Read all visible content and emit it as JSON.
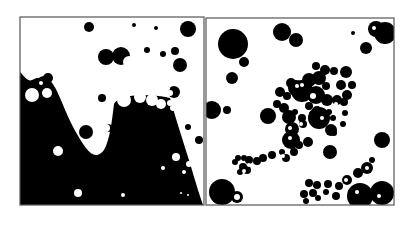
{
  "figure": {
    "background": "#ffffff",
    "ink": "#000000",
    "paper": "#ffffff",
    "frame_color": "#555555",
    "panels": [
      {
        "id": "left",
        "label": "disc packing over sloped terrain",
        "frame": {
          "x": 20,
          "y": 17,
          "w": 184,
          "h": 188
        },
        "terrain_path": "M20,72 C24,76 28,82 32,80 C38,78 42,74 48,78 C56,86 60,98 66,112 C72,126 80,140 86,148 C92,156 98,158 104,150 C110,140 112,120 114,104 C118,96 140,92 170,98 C176,120 186,150 192,170 C196,184 200,196 203,205 L20,205 Z",
        "black_discs": [
          [
            89,
            27,
            5
          ],
          [
            134,
            25,
            2
          ],
          [
            156,
            28,
            2
          ],
          [
            188,
            29,
            8
          ],
          [
            106,
            57,
            8
          ],
          [
            121,
            56,
            9
          ],
          [
            147,
            50,
            3
          ],
          [
            163,
            54,
            3
          ],
          [
            175,
            51,
            4
          ],
          [
            180,
            65,
            7
          ],
          [
            48,
            78,
            5
          ],
          [
            102,
            98,
            4
          ],
          [
            86,
            132,
            7
          ],
          [
            108,
            128,
            4
          ],
          [
            174,
            92,
            6
          ],
          [
            188,
            127,
            3
          ],
          [
            199,
            140,
            4
          ]
        ],
        "white_discs": [
          [
            36,
            71,
            3
          ],
          [
            38,
            75,
            3
          ],
          [
            32,
            95,
            7
          ],
          [
            47,
            93,
            5
          ],
          [
            41,
            83,
            2
          ],
          [
            129,
            62,
            6
          ],
          [
            137,
            54,
            3
          ],
          [
            146,
            59,
            3
          ],
          [
            140,
            67,
            3
          ],
          [
            155,
            64,
            3
          ],
          [
            131,
            74,
            3
          ],
          [
            140,
            73,
            3
          ],
          [
            148,
            72,
            3
          ],
          [
            157,
            73,
            3
          ],
          [
            164,
            80,
            3
          ],
          [
            125,
            83,
            3
          ],
          [
            133,
            82,
            3
          ],
          [
            141,
            81,
            3
          ],
          [
            150,
            82,
            3
          ],
          [
            158,
            83,
            3
          ],
          [
            167,
            88,
            3
          ],
          [
            122,
            90,
            3
          ],
          [
            130,
            89,
            3
          ],
          [
            138,
            89,
            3
          ],
          [
            146,
            91,
            3
          ],
          [
            154,
            90,
            3
          ],
          [
            162,
            91,
            3
          ],
          [
            170,
            93,
            3
          ],
          [
            124,
            100,
            7
          ],
          [
            140,
            97,
            6
          ],
          [
            152,
            100,
            6
          ],
          [
            161,
            104,
            5
          ],
          [
            170,
            103,
            3
          ],
          [
            173,
            108,
            3
          ],
          [
            178,
            113,
            2
          ],
          [
            180,
            120,
            3
          ],
          [
            58,
            151,
            5
          ],
          [
            78,
            193,
            4
          ],
          [
            123,
            195,
            2
          ],
          [
            176,
            157,
            4
          ],
          [
            189,
            164,
            3
          ],
          [
            163,
            168,
            2
          ],
          [
            184,
            172,
            2
          ],
          [
            196,
            172,
            2
          ],
          [
            181,
            193,
            1
          ],
          [
            188,
            195,
            1
          ],
          [
            106,
            128,
            4
          ]
        ]
      },
      {
        "id": "right",
        "label": "disc clustering in free space",
        "frame": {
          "x": 206,
          "y": 18,
          "w": 188,
          "h": 187
        },
        "black_discs": [
          [
            233,
            44,
            15
          ],
          [
            244,
            62,
            5
          ],
          [
            282,
            32,
            9
          ],
          [
            296,
            40,
            7
          ],
          [
            353,
            33,
            2
          ],
          [
            376,
            29,
            8
          ],
          [
            385,
            33,
            11
          ],
          [
            366,
            48,
            6
          ],
          [
            232,
            78,
            6
          ],
          [
            212,
            110,
            9
          ],
          [
            227,
            110,
            4
          ],
          [
            316,
            66,
            4
          ],
          [
            325,
            70,
            5
          ],
          [
            334,
            71,
            4
          ],
          [
            346,
            72,
            6
          ],
          [
            309,
            80,
            7
          ],
          [
            319,
            78,
            7
          ],
          [
            326,
            86,
            4
          ],
          [
            341,
            85,
            5
          ],
          [
            347,
            95,
            5
          ],
          [
            352,
            85,
            4
          ],
          [
            344,
            102,
            4
          ],
          [
            291,
            83,
            5
          ],
          [
            296,
            88,
            8
          ],
          [
            302,
            91,
            11
          ],
          [
            316,
            95,
            9
          ],
          [
            327,
            100,
            6
          ],
          [
            337,
            100,
            5
          ],
          [
            309,
            106,
            4
          ],
          [
            317,
            111,
            5
          ],
          [
            329,
            112,
            3
          ],
          [
            333,
            118,
            3
          ],
          [
            345,
            113,
            3
          ],
          [
            343,
            124,
            3
          ],
          [
            280,
            92,
            5
          ],
          [
            287,
            96,
            4
          ],
          [
            277,
            104,
            4
          ],
          [
            284,
            108,
            5
          ],
          [
            295,
            112,
            3
          ],
          [
            302,
            118,
            4
          ],
          [
            312,
            114,
            3
          ],
          [
            268,
            116,
            8
          ],
          [
            289,
            117,
            7
          ],
          [
            303,
            124,
            4
          ],
          [
            319,
            118,
            11
          ],
          [
            331,
            130,
            6
          ],
          [
            334,
            133,
            3
          ],
          [
            308,
            142,
            5
          ],
          [
            292,
            129,
            7
          ],
          [
            291,
            140,
            9
          ],
          [
            299,
            145,
            4
          ],
          [
            294,
            152,
            4
          ],
          [
            286,
            158,
            4
          ],
          [
            282,
            152,
            3
          ],
          [
            272,
            155,
            4
          ],
          [
            263,
            158,
            4
          ],
          [
            257,
            161,
            4
          ],
          [
            249,
            160,
            4
          ],
          [
            244,
            158,
            3
          ],
          [
            238,
            158,
            3
          ],
          [
            235,
            162,
            3
          ],
          [
            243,
            167,
            4
          ],
          [
            247,
            170,
            4
          ],
          [
            240,
            172,
            3
          ],
          [
            330,
            152,
            7
          ],
          [
            382,
            140,
            8
          ],
          [
            372,
            160,
            3
          ],
          [
            367,
            168,
            6
          ],
          [
            358,
            173,
            5
          ],
          [
            347,
            180,
            5
          ],
          [
            339,
            186,
            4
          ],
          [
            328,
            184,
            4
          ],
          [
            317,
            185,
            4
          ],
          [
            309,
            183,
            4
          ],
          [
            313,
            193,
            4
          ],
          [
            304,
            194,
            4
          ],
          [
            306,
            201,
            3
          ],
          [
            318,
            198,
            3
          ],
          [
            326,
            192,
            3
          ],
          [
            336,
            196,
            4
          ],
          [
            222,
            192,
            13
          ],
          [
            237,
            197,
            6
          ],
          [
            360,
            196,
            13
          ],
          [
            382,
            193,
            12
          ]
        ],
        "white_marks": [
          [
            297,
            86,
            2
          ],
          [
            302,
            85,
            2
          ],
          [
            313,
            96,
            3
          ],
          [
            336,
            104,
            2
          ],
          [
            322,
            118,
            2
          ],
          [
            301,
            124,
            2
          ],
          [
            290,
            128,
            2
          ],
          [
            290,
            138,
            2
          ],
          [
            283,
            156,
            2
          ],
          [
            249,
            165,
            2
          ],
          [
            244,
            171,
            2
          ],
          [
            237,
            197,
            3
          ],
          [
            346,
            180,
            2
          ],
          [
            367,
            168,
            2
          ],
          [
            374,
            28,
            2
          ],
          [
            357,
            192,
            2
          ],
          [
            379,
            196,
            2
          ]
        ]
      }
    ]
  }
}
